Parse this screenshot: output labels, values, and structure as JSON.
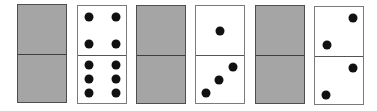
{
  "colors": {
    "background": "#ffffff",
    "face_down_fill": "#a5a5a5",
    "face_up_fill": "#ffffff",
    "pip": "#111111",
    "border": "#555555"
  },
  "dominoes": [
    {
      "index": 1,
      "state": "face-down",
      "top_value": null,
      "bottom_value": null
    },
    {
      "index": 2,
      "state": "face-up",
      "top_value": 4,
      "bottom_value": 6
    },
    {
      "index": 3,
      "state": "face-down",
      "top_value": null,
      "bottom_value": null
    },
    {
      "index": 4,
      "state": "face-up",
      "top_value": 1,
      "bottom_value": 3
    },
    {
      "index": 5,
      "state": "face-down",
      "top_value": null,
      "bottom_value": null
    },
    {
      "index": 6,
      "state": "face-up",
      "top_value": 2,
      "bottom_value": 2
    }
  ]
}
